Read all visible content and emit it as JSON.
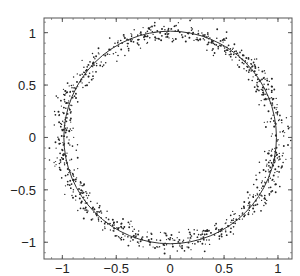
{
  "chart_data": {
    "type": "scatter",
    "title": "",
    "xlabel": "",
    "ylabel": "",
    "xlim": [
      -1.17,
      1.13
    ],
    "ylim": [
      -1.16,
      1.14
    ],
    "x_ticks": [
      -1,
      -0.5,
      0,
      0.5,
      1
    ],
    "x_tick_labels": [
      "−1",
      "−0.5",
      "0",
      "0.5",
      "1"
    ],
    "y_ticks": [
      1,
      0.5,
      0,
      -0.5,
      -1
    ],
    "y_tick_labels": [
      "1",
      "0.5",
      "0",
      "−0.5",
      "−1"
    ],
    "grid": false,
    "legend": null,
    "series": [
      {
        "name": "noisy samples",
        "kind": "scatter",
        "description": "Points scattered around the unit circle with radial noise",
        "center": [
          0,
          0
        ],
        "mean_radius": 1.0,
        "radial_noise_sd": 0.05,
        "count": 1000,
        "marker_color": "#222222",
        "marker_size": 1.2
      },
      {
        "name": "unit circle",
        "kind": "line",
        "equation": "x^2 + y^2 = 1",
        "radius": 1.0,
        "line_color": "#333333",
        "line_width": 1
      }
    ]
  },
  "colors": {
    "background": "#ffffff",
    "frame": "#555555",
    "points": "#222222",
    "circle": "#333333"
  }
}
